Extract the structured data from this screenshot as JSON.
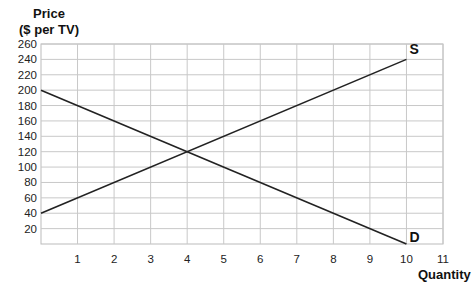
{
  "chart_data": {
    "type": "line",
    "title": "",
    "ylabel_lines": [
      "Price",
      "($ per TV)"
    ],
    "xlabel": "Quantity",
    "xlim": [
      0,
      11
    ],
    "ylim": [
      0,
      260
    ],
    "x_ticks": [
      1,
      2,
      3,
      4,
      5,
      6,
      7,
      8,
      9,
      10,
      11
    ],
    "y_ticks": [
      20,
      40,
      60,
      80,
      100,
      120,
      140,
      160,
      180,
      200,
      220,
      240,
      260
    ],
    "grid": true,
    "series": [
      {
        "name": "S",
        "label": "S",
        "points": [
          [
            0,
            40
          ],
          [
            10,
            240
          ]
        ]
      },
      {
        "name": "D",
        "label": "D",
        "points": [
          [
            0,
            200
          ],
          [
            10,
            0
          ]
        ]
      }
    ],
    "equilibrium": {
      "quantity": 4,
      "price": 120
    }
  },
  "colors": {
    "grid": "#c8c8c8",
    "line": "#222222",
    "axis": "#bbbbbb",
    "text": "#222222"
  }
}
